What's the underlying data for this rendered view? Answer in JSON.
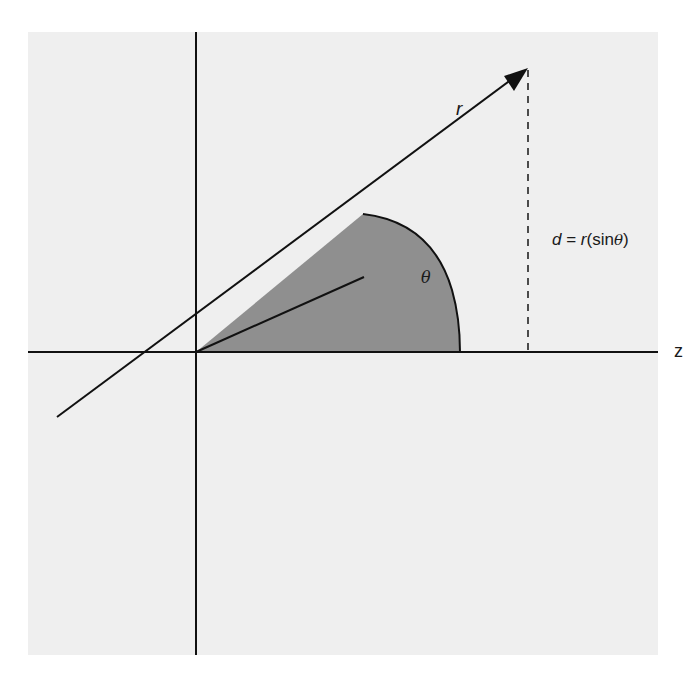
{
  "diagram": {
    "title": "",
    "colors": {
      "background_panel": "#efefef",
      "wedge_fill": "#8f8f8f",
      "stroke": "#111111",
      "page": "#ffffff"
    },
    "labels": {
      "r": "r",
      "theta": "θ",
      "z_axis": "z",
      "d_var": "d",
      "d_eq": " = ",
      "d_r": "r",
      "d_paren_open": "(sin",
      "d_theta": "θ",
      "d_paren_close": ")"
    },
    "formula": "d = r(sinθ)",
    "elements": [
      {
        "id": "vertical-axis",
        "type": "line"
      },
      {
        "id": "z-axis",
        "type": "line",
        "label": "z"
      },
      {
        "id": "radius-vector",
        "type": "arrow",
        "label": "r"
      },
      {
        "id": "shaded-wedge",
        "type": "sector",
        "label": "θ"
      },
      {
        "id": "inner-line",
        "type": "line"
      },
      {
        "id": "projection-line",
        "type": "dashed-line",
        "label": "d = r(sinθ)"
      }
    ]
  }
}
